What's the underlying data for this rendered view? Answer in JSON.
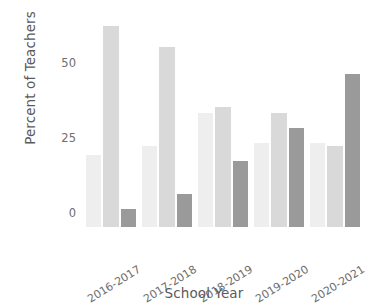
{
  "chart_data": {
    "type": "bar",
    "title": "",
    "subtitle": "",
    "xlabel": "School Year",
    "ylabel": "Percent of Teachers",
    "categories": [
      "2016-2017",
      "2017-2018",
      "2018-2019",
      "2019-2020",
      "2020-2021"
    ],
    "yticks": [
      0,
      25,
      50,
      75
    ],
    "ylim": [
      0,
      75
    ],
    "grid": false,
    "legend": "none",
    "series": [
      {
        "name": "series-1",
        "color": "#eeeeee",
        "values": [
          24,
          27,
          38,
          28,
          28
        ]
      },
      {
        "name": "series-2",
        "color": "#d9d9d9",
        "values": [
          67,
          60,
          40,
          38,
          27
        ]
      },
      {
        "name": "series-3",
        "color": "#9a9a9a",
        "values": [
          6,
          11,
          22,
          33,
          51
        ]
      }
    ]
  },
  "axis": {
    "ytick_labels": [
      "0",
      "25",
      "50",
      "75"
    ]
  }
}
